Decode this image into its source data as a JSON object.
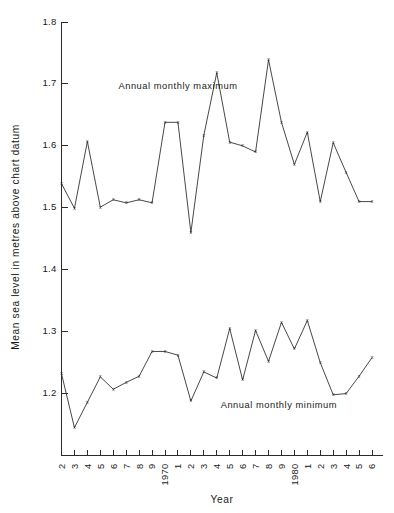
{
  "chart_data": {
    "type": "line",
    "title": "",
    "xlabel": "Year",
    "ylabel": "Mean sea level in metres above chart datum",
    "xlim": [
      1962,
      1986
    ],
    "ylim": [
      1.1,
      1.8
    ],
    "yticks": [
      "1.2",
      "1.3",
      "1.4",
      "1.5",
      "1.6",
      "1.7",
      "1.8"
    ],
    "ytick_values": [
      1.2,
      1.3,
      1.4,
      1.5,
      1.6,
      1.7,
      1.8
    ],
    "xtick_labels": [
      "2",
      "3",
      "4",
      "5",
      "6",
      "7",
      "8",
      "9",
      "1970",
      "1",
      "2",
      "3",
      "4",
      "5",
      "6",
      "7",
      "8",
      "9",
      "1980",
      "1",
      "2",
      "3",
      "4",
      "5",
      "6"
    ],
    "x": [
      1962,
      1963,
      1964,
      1965,
      1966,
      1967,
      1968,
      1969,
      1970,
      1971,
      1972,
      1973,
      1974,
      1975,
      1976,
      1977,
      1978,
      1979,
      1980,
      1981,
      1982,
      1983,
      1984,
      1985,
      1986
    ],
    "grid": false,
    "legend_position": "inline-annotation",
    "marker": "x",
    "series": [
      {
        "name": "Annual monthly maximum",
        "values": [
          1.539,
          1.499,
          1.607,
          1.501,
          1.513,
          1.508,
          1.513,
          1.508,
          1.638,
          1.638,
          1.46,
          1.617,
          1.718,
          1.606,
          1.6,
          1.59,
          1.739,
          1.638,
          1.57,
          1.622,
          1.51,
          1.605,
          1.557,
          1.51,
          1.51
        ],
        "annotation": "Annual monthly maximum",
        "annotation_x": 1966.4,
        "annotation_y": 1.692
      },
      {
        "name": "Annual monthly minimum",
        "values": [
          1.232,
          1.145,
          1.186,
          1.227,
          1.207,
          1.218,
          1.228,
          1.268,
          1.268,
          1.262,
          1.188,
          1.235,
          1.225,
          1.305,
          1.222,
          1.302,
          1.252,
          1.315,
          1.272,
          1.318,
          1.25,
          1.198,
          1.2,
          1.228,
          1.258
        ],
        "annotation": "Annual monthly minimum",
        "annotation_x": 1974.3,
        "annotation_y": 1.177
      }
    ]
  },
  "labels": {
    "y_axis_title": "Mean sea level in metres above chart datum",
    "x_axis_title": "Year",
    "max_annotation": "Annual monthly maximum",
    "min_annotation": "Annual monthly minimum"
  }
}
